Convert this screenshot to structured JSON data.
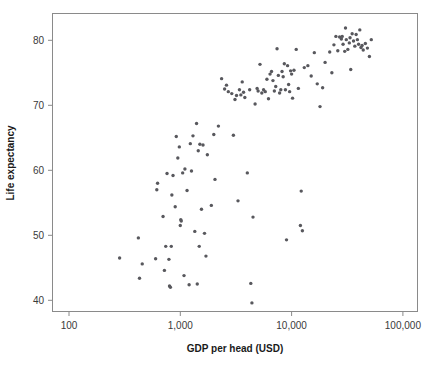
{
  "chart_data": {
    "type": "scatter",
    "title": "",
    "subtitle": "",
    "xlabel": "GDP per head (USD)",
    "ylabel": "Life expectancy",
    "x_scale": "log",
    "y_scale": "linear",
    "x_tick_labels": [
      "100",
      "1,000",
      "10,000",
      "100,000"
    ],
    "x_tick_values": [
      100,
      1000,
      10000,
      100000
    ],
    "y_tick_labels": [
      "40",
      "50",
      "60",
      "70",
      "80"
    ],
    "y_tick_values": [
      40,
      50,
      60,
      70,
      80
    ],
    "xlim": [
      63,
      158000
    ],
    "ylim": [
      38.2,
      84.2
    ],
    "grid": false,
    "legend": null,
    "marker_color": "#58585d",
    "marker_size_px": 3.4,
    "frame_color": "#8a8a8a",
    "background_color": "#ffffff",
    "series": [
      {
        "name": "countries",
        "points": [
          [
            285,
            46.5
          ],
          [
            420,
            49.6
          ],
          [
            430,
            43.4
          ],
          [
            455,
            45.6
          ],
          [
            600,
            46.4
          ],
          [
            615,
            57.0
          ],
          [
            625,
            58.0
          ],
          [
            700,
            52.9
          ],
          [
            720,
            44.6
          ],
          [
            740,
            48.3
          ],
          [
            760,
            59.5
          ],
          [
            790,
            46.3
          ],
          [
            800,
            42.2
          ],
          [
            815,
            42.0
          ],
          [
            830,
            48.3
          ],
          [
            840,
            56.2
          ],
          [
            860,
            59.2
          ],
          [
            900,
            54.4
          ],
          [
            920,
            65.2
          ],
          [
            950,
            61.9
          ],
          [
            980,
            63.6
          ],
          [
            1000,
            51.5
          ],
          [
            1010,
            52.4
          ],
          [
            1020,
            52.2
          ],
          [
            1050,
            59.6
          ],
          [
            1080,
            43.8
          ],
          [
            1100,
            60.2
          ],
          [
            1150,
            56.9
          ],
          [
            1200,
            42.4
          ],
          [
            1230,
            64.1
          ],
          [
            1260,
            59.9
          ],
          [
            1300,
            65.3
          ],
          [
            1350,
            50.6
          ],
          [
            1400,
            67.2
          ],
          [
            1420,
            42.5
          ],
          [
            1450,
            63.0
          ],
          [
            1480,
            48.3
          ],
          [
            1500,
            64.0
          ],
          [
            1550,
            54.0
          ],
          [
            1600,
            63.9
          ],
          [
            1650,
            50.3
          ],
          [
            1700,
            46.8
          ],
          [
            1750,
            62.4
          ],
          [
            1900,
            54.6
          ],
          [
            2000,
            65.5
          ],
          [
            2050,
            58.6
          ],
          [
            2200,
            66.8
          ],
          [
            2350,
            74.1
          ],
          [
            2500,
            72.5
          ],
          [
            2600,
            73.1
          ],
          [
            2700,
            72.1
          ],
          [
            2900,
            71.8
          ],
          [
            3000,
            65.4
          ],
          [
            3100,
            70.9
          ],
          [
            3200,
            71.5
          ],
          [
            3300,
            55.3
          ],
          [
            3400,
            72.4
          ],
          [
            3500,
            71.6
          ],
          [
            3600,
            73.6
          ],
          [
            3700,
            72.0
          ],
          [
            3800,
            71.2
          ],
          [
            4000,
            59.6
          ],
          [
            4200,
            72.4
          ],
          [
            4300,
            42.6
          ],
          [
            4400,
            39.6
          ],
          [
            4500,
            52.8
          ],
          [
            4700,
            70.2
          ],
          [
            4900,
            72.6
          ],
          [
            5000,
            72.2
          ],
          [
            5200,
            76.3
          ],
          [
            5400,
            71.9
          ],
          [
            5600,
            72.4
          ],
          [
            5800,
            72.1
          ],
          [
            6000,
            74.0
          ],
          [
            6200,
            71.0
          ],
          [
            6400,
            74.8
          ],
          [
            6600,
            75.2
          ],
          [
            6800,
            73.8
          ],
          [
            7000,
            72.2
          ],
          [
            7200,
            72.9
          ],
          [
            7400,
            78.7
          ],
          [
            7600,
            74.6
          ],
          [
            7800,
            71.9
          ],
          [
            8000,
            72.4
          ],
          [
            8200,
            75.2
          ],
          [
            8400,
            74.4
          ],
          [
            8600,
            76.4
          ],
          [
            8800,
            72.4
          ],
          [
            9000,
            49.3
          ],
          [
            9200,
            76.1
          ],
          [
            9400,
            73.2
          ],
          [
            9600,
            72.1
          ],
          [
            9800,
            75.3
          ],
          [
            10000,
            74.8
          ],
          [
            10200,
            71.1
          ],
          [
            10500,
            75.4
          ],
          [
            11000,
            78.6
          ],
          [
            11500,
            72.6
          ],
          [
            12000,
            51.5
          ],
          [
            12200,
            56.8
          ],
          [
            12500,
            50.7
          ],
          [
            13000,
            75.8
          ],
          [
            14000,
            76.1
          ],
          [
            15000,
            74.5
          ],
          [
            16000,
            78.1
          ],
          [
            17000,
            73.3
          ],
          [
            18000,
            69.8
          ],
          [
            19000,
            72.7
          ],
          [
            20000,
            76.6
          ],
          [
            22000,
            78.2
          ],
          [
            23000,
            75.0
          ],
          [
            24000,
            79.3
          ],
          [
            25000,
            80.6
          ],
          [
            26000,
            78.4
          ],
          [
            27000,
            80.5
          ],
          [
            28000,
            80.2
          ],
          [
            28500,
            80.6
          ],
          [
            29000,
            79.4
          ],
          [
            30000,
            78.3
          ],
          [
            30500,
            81.9
          ],
          [
            31000,
            80.1
          ],
          [
            32000,
            78.6
          ],
          [
            33000,
            79.6
          ],
          [
            33500,
            80.4
          ],
          [
            34000,
            75.5
          ],
          [
            35000,
            81.0
          ],
          [
            36000,
            79.9
          ],
          [
            37000,
            79.1
          ],
          [
            38000,
            80.9
          ],
          [
            39000,
            80.1
          ],
          [
            40000,
            79.4
          ],
          [
            41000,
            81.6
          ],
          [
            42000,
            78.9
          ],
          [
            43000,
            79.2
          ],
          [
            44000,
            78.5
          ],
          [
            46000,
            79.5
          ],
          [
            48000,
            78.8
          ],
          [
            50000,
            77.5
          ],
          [
            52000,
            80.1
          ]
        ]
      }
    ]
  },
  "geometry": {
    "plot_left_px": 52,
    "plot_right_px": 418,
    "plot_top_px": 13,
    "plot_bottom_px": 312,
    "x_decade_px": 111.3,
    "x100_px": 69
  }
}
